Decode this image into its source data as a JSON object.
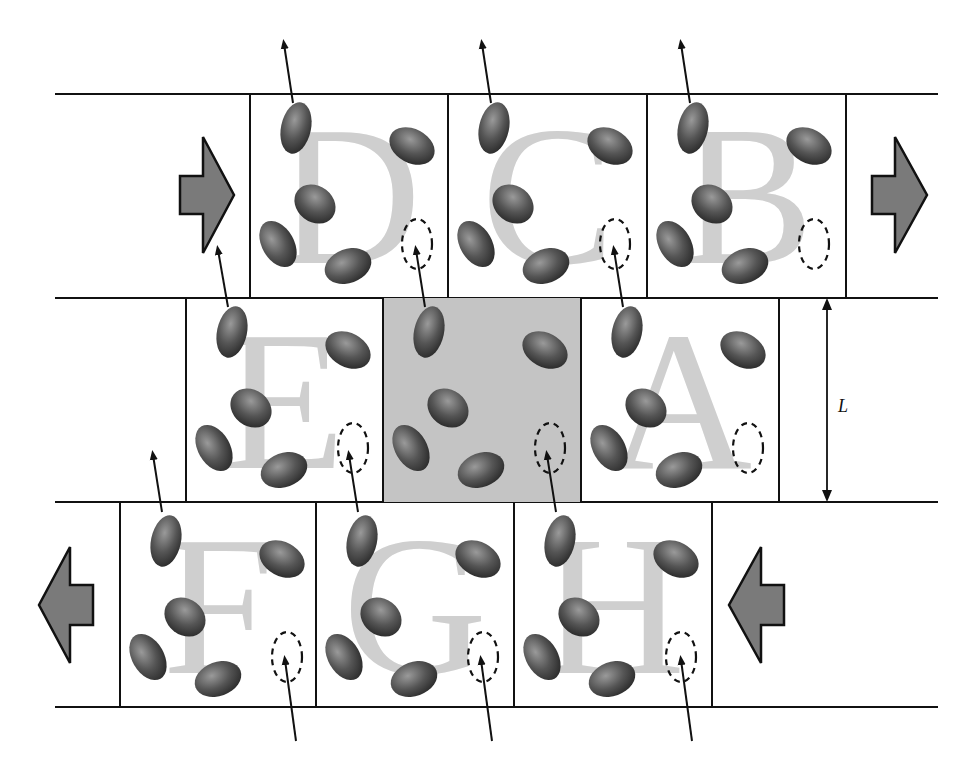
{
  "diagram": {
    "type": "crystal-lattice-slip / layered cells schematic",
    "dimension_label": "L",
    "colors": {
      "line": "#111111",
      "letter": "#cfcfcf",
      "molecule_dark": "#2e2e2e",
      "molecule_light": "#8a8a8a",
      "highlight_cell": "#c4c4c4",
      "flow_arrow": "#7a7a7a"
    },
    "rows": [
      {
        "id": "top",
        "flow_direction": "right",
        "cells": [
          {
            "label": "D",
            "shaded": false
          },
          {
            "label": "C",
            "shaded": false
          },
          {
            "label": "B",
            "shaded": false
          }
        ]
      },
      {
        "id": "middle",
        "flow_direction": "none",
        "cells": [
          {
            "label": "E",
            "shaded": false
          },
          {
            "label": "",
            "shaded": true
          },
          {
            "label": "A",
            "shaded": false
          }
        ]
      },
      {
        "id": "bottom",
        "flow_direction": "left",
        "cells": [
          {
            "label": "F",
            "shaded": false
          },
          {
            "label": "G",
            "shaded": false
          },
          {
            "label": "H",
            "shaded": false
          }
        ]
      }
    ]
  }
}
